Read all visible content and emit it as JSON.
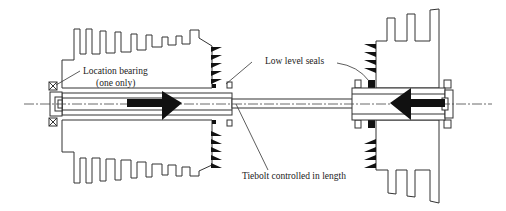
{
  "figure": {
    "type": "engineering cross-section",
    "colors": {
      "line": "#333333",
      "fill_solid": "#111111",
      "background": "#ffffff"
    }
  },
  "labels": {
    "location_bearing": {
      "line1": "Location bearing",
      "line2": "(one only)"
    },
    "low_level_seals": "Low level seals",
    "tiebolt": "Tiebolt controlled in length"
  },
  "components": [
    {
      "name": "left-disk",
      "description": "finned rotor disk, left"
    },
    {
      "name": "right-disk",
      "description": "finned rotor disk, right"
    },
    {
      "name": "location-bearing",
      "description": "bearing symbol (crossed box), left end"
    },
    {
      "name": "labyrinth-seals",
      "description": "black triangular seal teeth"
    },
    {
      "name": "low-level-seals",
      "description": "small black seal blocks at shaft"
    },
    {
      "name": "tiebolt",
      "description": "central rod"
    },
    {
      "name": "axial-force-arrows",
      "description": "two black arrows pointing toward each other"
    },
    {
      "name": "centerline",
      "description": "dash-dot axis line"
    }
  ]
}
